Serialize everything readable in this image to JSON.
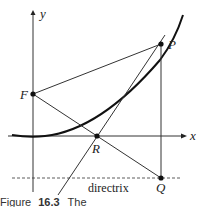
{
  "figure": {
    "labels": {
      "y_axis": "y",
      "x_axis": "x",
      "focus": "F",
      "point_p": "P",
      "point_r": "R",
      "point_q": "Q",
      "directrix": "directrix"
    },
    "caption": {
      "prefix": "Figure",
      "number": "16.3",
      "text": "The"
    }
  }
}
